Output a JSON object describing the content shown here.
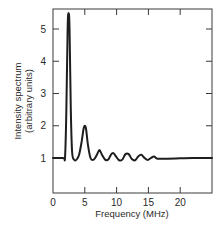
{
  "chart_data": {
    "type": "line",
    "title": "",
    "xlabel": "Frequency (MHz)",
    "ylabel_line1": "Intensity spectrum",
    "ylabel_line2": "(arbitrary units)",
    "xlim": [
      0,
      25
    ],
    "ylim": [
      0,
      5.6
    ],
    "x_ticks": [
      0,
      5,
      10,
      15,
      20
    ],
    "x_tick_labels": [
      "0",
      "5",
      "10",
      "15",
      "20"
    ],
    "y_ticks": [
      1,
      2,
      3,
      4,
      5
    ],
    "y_tick_labels": [
      "1",
      "2",
      "3",
      "4",
      "5"
    ],
    "grid": false,
    "legend": null,
    "series": [
      {
        "name": "Intensity spectrum",
        "x": [
          0,
          1.6,
          1.9,
          2.1,
          2.3,
          2.45,
          2.6,
          2.8,
          3.0,
          3.3,
          3.7,
          4.1,
          4.5,
          4.8,
          5.0,
          5.2,
          5.5,
          5.9,
          6.4,
          6.9,
          7.3,
          7.7,
          8.2,
          8.7,
          9.1,
          9.5,
          9.9,
          10.4,
          10.9,
          11.4,
          11.9,
          12.4,
          12.9,
          13.4,
          13.9,
          14.4,
          14.9,
          15.4,
          15.9,
          16.4,
          18,
          20,
          22,
          25
        ],
        "y": [
          1.0,
          1.0,
          1.05,
          2.5,
          5.0,
          5.5,
          5.0,
          2.5,
          1.2,
          0.95,
          0.95,
          1.1,
          1.5,
          1.9,
          2.0,
          1.9,
          1.4,
          1.0,
          0.95,
          1.1,
          1.25,
          1.1,
          0.95,
          0.95,
          1.1,
          1.15,
          1.05,
          0.93,
          0.95,
          1.12,
          1.12,
          0.97,
          0.93,
          1.05,
          1.1,
          1.0,
          0.94,
          1.0,
          1.05,
          0.98,
          0.98,
          0.99,
          1.0,
          1.0
        ]
      }
    ],
    "peaks": [
      {
        "x": 2.45,
        "y": 5.5
      },
      {
        "x": 5.0,
        "y": 2.0
      },
      {
        "x": 7.3,
        "y": 1.25
      },
      {
        "x": 9.5,
        "y": 1.15
      },
      {
        "x": 11.7,
        "y": 1.12
      },
      {
        "x": 13.9,
        "y": 1.1
      },
      {
        "x": 16.0,
        "y": 1.05
      }
    ],
    "baseline": 1.0
  },
  "style": {
    "line_color": "#1e1e1e",
    "axis_color": "#3a3a3a",
    "background": "#ffffff"
  }
}
